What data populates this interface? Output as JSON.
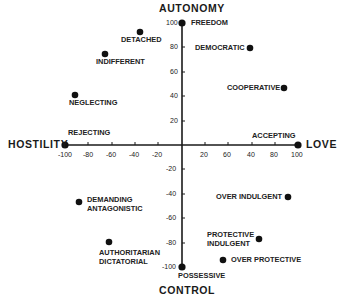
{
  "axis_titles": {
    "top": "AUTONOMY",
    "bottom": "CONTROL",
    "left": "HOSTILITY",
    "right": "LOVE"
  },
  "x_ticks": [
    "-100",
    "-80",
    "-60",
    "-40",
    "-20",
    "20",
    "60",
    "40",
    "80",
    "100"
  ],
  "y_ticks": [
    "100",
    "80",
    "60",
    "40",
    "20",
    "-20",
    "-40",
    "-60",
    "-80",
    "-100"
  ],
  "points": [
    {
      "label": "FREEDOM",
      "x": 0,
      "y": 100
    },
    {
      "label": "DETACHED",
      "x": -36,
      "y": 92
    },
    {
      "label": "INDIFFERENT",
      "x": -66,
      "y": 75
    },
    {
      "label": "DEMOCRATIC",
      "x": 58,
      "y": 80
    },
    {
      "label": "NEGLECTING",
      "x": -91,
      "y": 41
    },
    {
      "label": "COOPERATIVE",
      "x": 87,
      "y": 47
    },
    {
      "label": "REJECTING",
      "x": -100,
      "y": 0
    },
    {
      "label": "ACCEPTING",
      "x": 100,
      "y": 0
    },
    {
      "label": "DEMANDING",
      "label2": "ANTAGONISTIC",
      "x": -88,
      "y": -47
    },
    {
      "label": "OVER INDULGENT",
      "x": 90,
      "y": -43
    },
    {
      "label": "AUTHORITARIAN",
      "label2": "DICTATORIAL",
      "x": -62,
      "y": -80
    },
    {
      "label": "PROTECTIVE",
      "label2": "INDULGENT",
      "x": 66,
      "y": -77
    },
    {
      "label": "OVER PROTECTIVE",
      "x": 35,
      "y": -94
    },
    {
      "label": "POSSESSIVE",
      "x": 0,
      "y": -100
    }
  ]
}
